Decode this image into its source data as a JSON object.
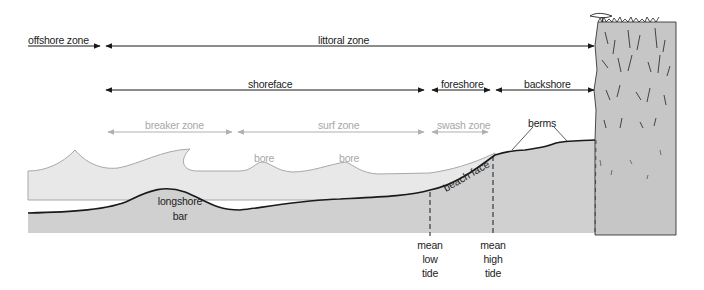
{
  "diagram": {
    "zones_top": {
      "offshore": "offshore zone",
      "littoral": "littoral zone"
    },
    "zones_middle": {
      "shoreface": "shoreface",
      "foreshore": "foreshore",
      "backshore": "backshore"
    },
    "zones_wave": {
      "breaker": "breaker zone",
      "surf": "surf zone",
      "swash": "swash zone"
    },
    "features": {
      "bore_1": "bore",
      "bore_2": "bore",
      "berms": "berms",
      "longshore_bar_line1": "longshore",
      "longshore_bar_line2": "bar",
      "beach_face": "beach face"
    },
    "tide_markers": {
      "low": [
        "mean",
        "low",
        "tide"
      ],
      "high": [
        "mean",
        "high",
        "tide"
      ]
    },
    "colors": {
      "water": "#e6e6e6",
      "sediment": "#cfcfcf",
      "cliff": "#c8c8c8",
      "line_dark": "#1a1a1a",
      "line_light": "#b0b0b0"
    }
  }
}
